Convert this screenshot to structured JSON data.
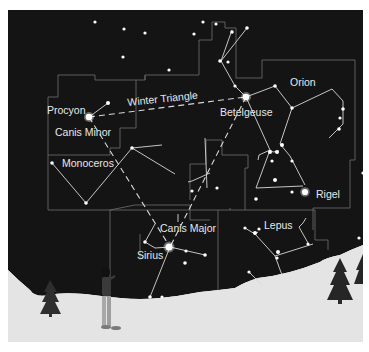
{
  "figure": {
    "colors": {
      "sky": "#141414",
      "snow": "#e4e4e4",
      "boundary": "#6e6e6e",
      "stick_line": "#d8d8d8",
      "star": "#ffffff",
      "label": "#e8e8e8",
      "tree": "#2a2a2a"
    }
  },
  "labels": {
    "procyon": "Procyon",
    "canis_minor": "Canis Minor",
    "winter_triangle": "Winter Triangle",
    "betelgeuse": "Betelgeuse",
    "orion": "Orion",
    "monoceros": "Monoceros",
    "rigel": "Rigel",
    "canis_major": "Canis Major",
    "sirius": "Sirius",
    "lepus": "Lepus"
  },
  "constellations": [
    {
      "name": "Canis Minor",
      "bright_star": "Procyon"
    },
    {
      "name": "Orion",
      "bright_stars": [
        "Betelgeuse",
        "Rigel"
      ]
    },
    {
      "name": "Monoceros"
    },
    {
      "name": "Canis Major",
      "bright_star": "Sirius"
    },
    {
      "name": "Lepus"
    }
  ],
  "asterism": {
    "name": "Winter Triangle",
    "vertices": [
      "Procyon",
      "Betelgeuse",
      "Sirius"
    ]
  },
  "icons": {
    "observer": "person-figure",
    "tree_left": "pine-tree",
    "tree_right": "pine-tree"
  }
}
